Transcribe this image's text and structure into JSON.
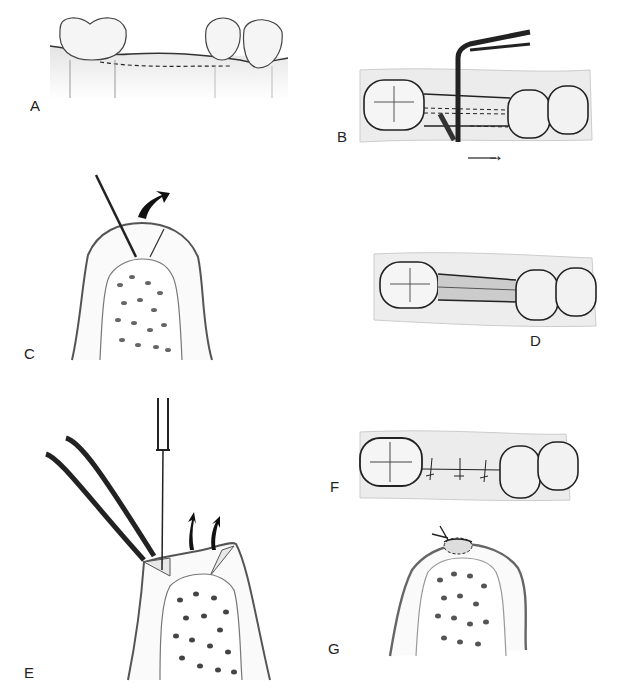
{
  "figure": {
    "panels": [
      {
        "id": "A",
        "label": "A",
        "description": "Lateral view of edentulous ridge between molar and premolars with dashed incision line"
      },
      {
        "id": "B",
        "label": "B",
        "description": "Occlusal view with periosteal elevator undermining the flap, arrow indicating direction"
      },
      {
        "id": "C",
        "label": "C",
        "description": "Cross-section of ridge with blade incision and curved arrow"
      },
      {
        "id": "D",
        "label": "D",
        "description": "Occlusal view of excised wedge of tissue between teeth"
      },
      {
        "id": "E",
        "label": "E",
        "description": "Cross-section with forceps and blade thinning flaps, arrows showing removal"
      },
      {
        "id": "F",
        "label": "F",
        "description": "Occlusal view of sutured flaps between teeth"
      },
      {
        "id": "G",
        "label": "G",
        "description": "Cross-section of closed ridge with suture knot"
      }
    ],
    "direction_arrow": "→",
    "caption": ""
  }
}
